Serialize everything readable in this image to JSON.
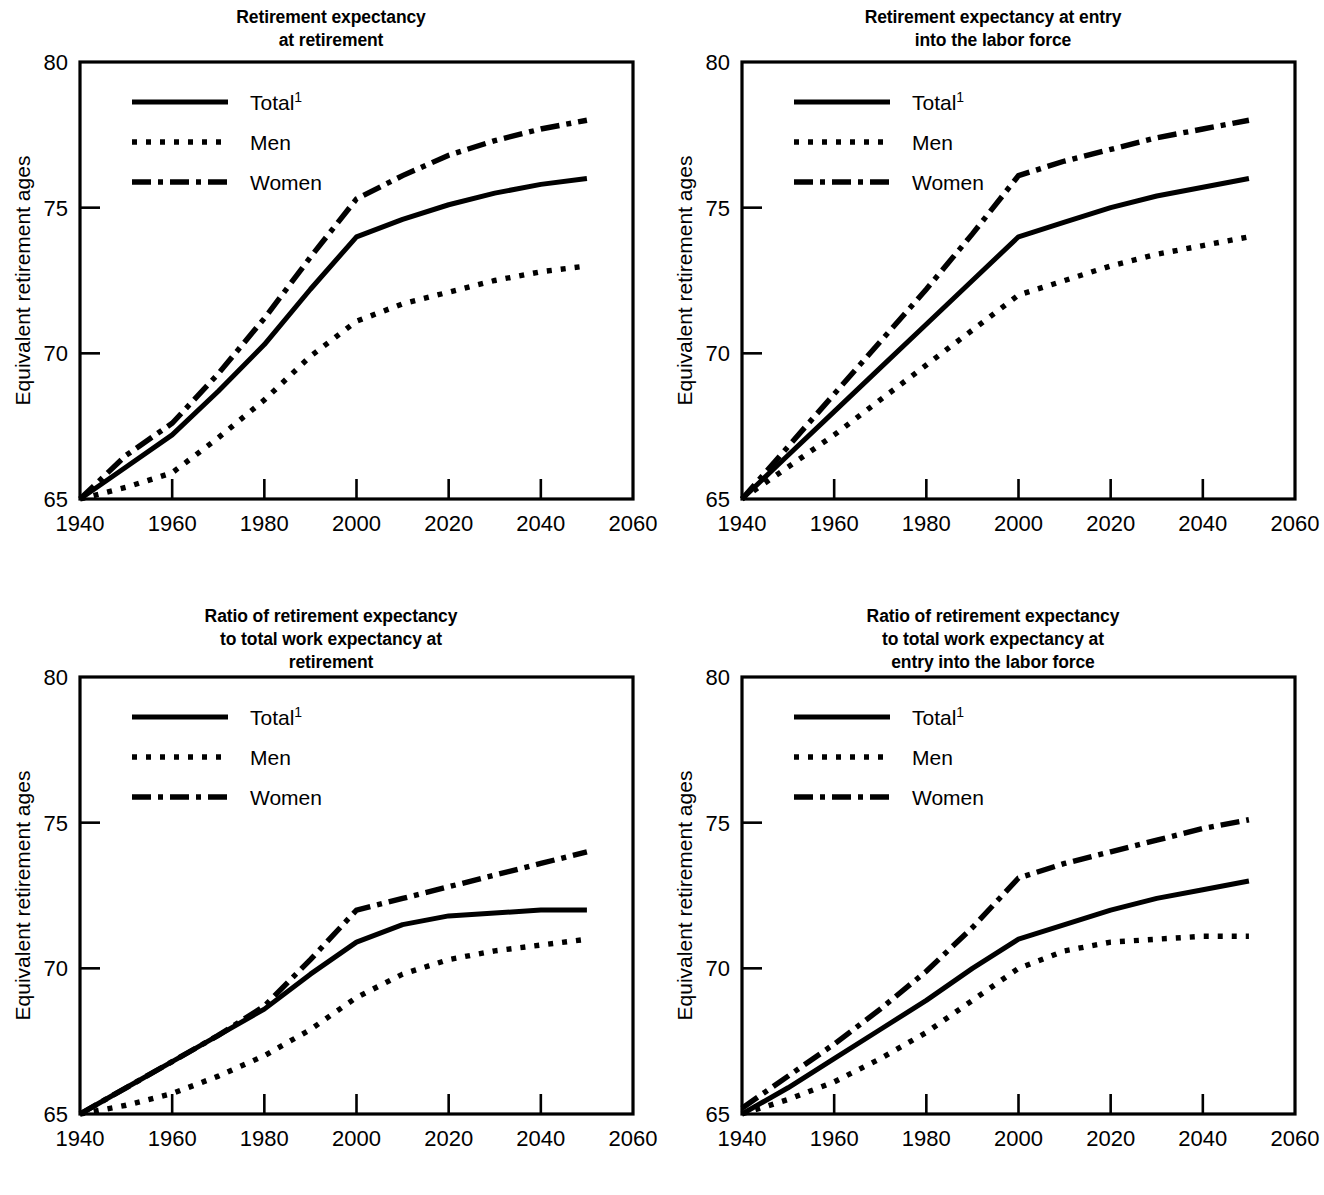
{
  "figure": {
    "axis": {
      "xlabel": "Year",
      "ylabel": "Equivalent retirement ages",
      "xticks": [
        "1940",
        "1960",
        "1980",
        "2000",
        "2020",
        "2040",
        "2060"
      ],
      "yticks": [
        "65",
        "70",
        "75",
        "80"
      ],
      "xlim": [
        1940,
        2060
      ],
      "ylim": [
        65,
        80
      ]
    },
    "legend": {
      "total_label": "Total",
      "total_superscript": "1",
      "men_label": "Men",
      "women_label": "Women"
    }
  },
  "chart_data": [
    {
      "id": "retirement-expectancy-at-retirement",
      "type": "line",
      "title": "Retirement expectancy\nat retirement",
      "xlabel": "Year",
      "ylabel": "Equivalent retirement ages",
      "xlim": [
        1940,
        2060
      ],
      "ylim": [
        65,
        80
      ],
      "grid": false,
      "legend_position": "top-left",
      "x": [
        1940,
        1950,
        1960,
        1970,
        1980,
        1990,
        2000,
        2010,
        2020,
        2030,
        2040,
        2050
      ],
      "series": [
        {
          "name": "Total",
          "style": "solid",
          "values": [
            65.0,
            66.1,
            67.2,
            68.7,
            70.3,
            72.2,
            74.0,
            74.6,
            75.1,
            75.5,
            75.8,
            76.0
          ]
        },
        {
          "name": "Men",
          "style": "dotted",
          "values": [
            65.0,
            65.4,
            65.9,
            67.1,
            68.4,
            69.9,
            71.1,
            71.7,
            72.1,
            72.5,
            72.8,
            73.0
          ]
        },
        {
          "name": "Women",
          "style": "dash-dot",
          "values": [
            65.0,
            66.5,
            67.6,
            69.3,
            71.2,
            73.3,
            75.3,
            76.1,
            76.8,
            77.3,
            77.7,
            78.0
          ]
        }
      ]
    },
    {
      "id": "retirement-expectancy-at-entry-into-labor-force",
      "type": "line",
      "title": "Retirement expectancy at entry\ninto the labor force",
      "xlabel": "Year",
      "ylabel": "Equivalent retirement ages",
      "xlim": [
        1940,
        2060
      ],
      "ylim": [
        65,
        80
      ],
      "grid": false,
      "legend_position": "top-left",
      "x": [
        1940,
        1950,
        1960,
        1970,
        1980,
        1990,
        2000,
        2010,
        2020,
        2030,
        2040,
        2050
      ],
      "series": [
        {
          "name": "Total",
          "style": "solid",
          "values": [
            65.0,
            66.5,
            68.0,
            69.5,
            71.0,
            72.5,
            74.0,
            74.5,
            75.0,
            75.4,
            75.7,
            76.0
          ]
        },
        {
          "name": "Men",
          "style": "dotted",
          "values": [
            65.0,
            66.1,
            67.2,
            68.4,
            69.6,
            70.8,
            72.0,
            72.5,
            73.0,
            73.4,
            73.7,
            74.0
          ]
        },
        {
          "name": "Women",
          "style": "dash-dot",
          "values": [
            65.0,
            66.8,
            68.6,
            70.4,
            72.2,
            74.1,
            76.1,
            76.6,
            77.0,
            77.4,
            77.7,
            78.0
          ]
        }
      ]
    },
    {
      "id": "ratio-retirement-to-work-expectancy-at-retirement",
      "type": "line",
      "title": "Ratio of retirement expectancy\nto total work expectancy at\nretirement",
      "xlabel": "Year",
      "ylabel": "Equivalent retirement ages",
      "xlim": [
        1940,
        2060
      ],
      "ylim": [
        65,
        80
      ],
      "grid": false,
      "legend_position": "top-left",
      "x": [
        1940,
        1950,
        1960,
        1970,
        1980,
        1990,
        2000,
        2010,
        2020,
        2030,
        2040,
        2050
      ],
      "series": [
        {
          "name": "Total",
          "style": "solid",
          "values": [
            65.0,
            65.9,
            66.8,
            67.7,
            68.6,
            69.8,
            70.9,
            71.5,
            71.8,
            71.9,
            72.0,
            72.0
          ]
        },
        {
          "name": "Men",
          "style": "dotted",
          "values": [
            65.0,
            65.3,
            65.7,
            66.3,
            67.0,
            67.9,
            69.0,
            69.8,
            70.3,
            70.6,
            70.8,
            71.0
          ]
        },
        {
          "name": "Women",
          "style": "dash-dot",
          "values": [
            65.0,
            65.9,
            66.8,
            67.7,
            68.7,
            70.3,
            72.0,
            72.4,
            72.8,
            73.2,
            73.6,
            74.0
          ]
        }
      ]
    },
    {
      "id": "ratio-retirement-to-work-expectancy-at-entry",
      "type": "line",
      "title": "Ratio of retirement expectancy\nto total work expectancy at\nentry into the labor force",
      "xlabel": "Year",
      "ylabel": "Equivalent retirement ages",
      "xlim": [
        1940,
        2060
      ],
      "ylim": [
        65,
        80
      ],
      "grid": false,
      "legend_position": "top-left",
      "x": [
        1940,
        1950,
        1960,
        1970,
        1980,
        1990,
        2000,
        2010,
        2020,
        2030,
        2040,
        2050
      ],
      "series": [
        {
          "name": "Total",
          "style": "solid",
          "values": [
            65.0,
            65.9,
            66.9,
            67.9,
            68.9,
            70.0,
            71.0,
            71.5,
            72.0,
            72.4,
            72.7,
            73.0
          ]
        },
        {
          "name": "Men",
          "style": "dotted",
          "values": [
            65.0,
            65.5,
            66.1,
            66.9,
            67.8,
            68.9,
            70.0,
            70.6,
            70.9,
            71.0,
            71.1,
            71.1
          ]
        },
        {
          "name": "Women",
          "style": "dash-dot",
          "values": [
            65.2,
            66.3,
            67.4,
            68.6,
            69.9,
            71.4,
            73.1,
            73.6,
            74.0,
            74.4,
            74.8,
            75.1
          ]
        }
      ]
    }
  ]
}
